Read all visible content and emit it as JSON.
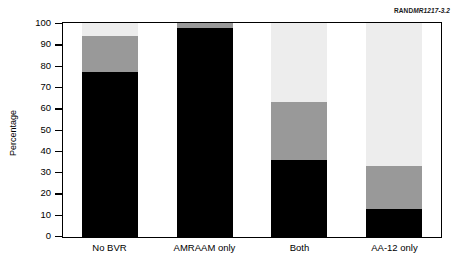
{
  "figure": {
    "id_prefix": "RAND",
    "id_suffix": "MR1217-3.2",
    "id_full": "RANDMR1217-3.2"
  },
  "chart_data": {
    "type": "bar",
    "subtype": "stacked-bar-100",
    "title": "",
    "subtitle": "",
    "xlabel": "",
    "ylabel": "Percentage",
    "ylim": [
      0,
      100
    ],
    "ytick_step": 10,
    "ytick_labels": [
      "100",
      "90",
      "80",
      "70",
      "60",
      "50",
      "40",
      "30",
      "20",
      "10",
      "0"
    ],
    "ytick_values": [
      100,
      90,
      80,
      70,
      60,
      50,
      40,
      30,
      20,
      10,
      0
    ],
    "grid": false,
    "legend": "none",
    "categories": [
      "No BVR",
      "AMRAAM only",
      "Both",
      "AA-12 only"
    ],
    "series": [
      {
        "name": "black-segment",
        "color": "#000000",
        "values": [
          77,
          97.5,
          36,
          13
        ]
      },
      {
        "name": "gray-segment",
        "color": "#999999",
        "values": [
          17,
          2.5,
          27,
          20
        ]
      },
      {
        "name": "light-segment",
        "color": "#ededed",
        "values": [
          6,
          0,
          37,
          67
        ]
      }
    ],
    "cumulative_tops": {
      "black": [
        77,
        97.5,
        36,
        13
      ],
      "gray": [
        94,
        100,
        63,
        33
      ],
      "light": [
        100,
        100,
        100,
        100
      ]
    },
    "annotations": []
  }
}
